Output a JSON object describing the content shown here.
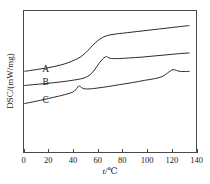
{
  "chart_data": {
    "type": "line",
    "title": "",
    "xlabel": "t/℃",
    "ylabel": "DSC/(mW/mg)",
    "xlim": [
      0,
      140
    ],
    "xticks": [
      0,
      20,
      40,
      60,
      80,
      100,
      120,
      140
    ],
    "xtick_labels": [
      "0",
      "20",
      "40",
      "60",
      "80",
      "100",
      "120",
      "140"
    ],
    "yticks": [],
    "ytick_labels": [],
    "grid": false,
    "legend": "inline-curve-labels",
    "series": [
      {
        "name": "A",
        "label": "A",
        "label_x": 18,
        "label_y": 0.565,
        "color": "#2b2b2b",
        "x": [
          1,
          6,
          12,
          18,
          24,
          30,
          36,
          42,
          46,
          50,
          54,
          58,
          62,
          66,
          70,
          74,
          78,
          84,
          92,
          100,
          110,
          120,
          130,
          134
        ],
        "y": [
          0.572,
          0.578,
          0.586,
          0.594,
          0.604,
          0.616,
          0.632,
          0.654,
          0.672,
          0.7,
          0.736,
          0.772,
          0.8,
          0.818,
          0.828,
          0.834,
          0.838,
          0.844,
          0.852,
          0.86,
          0.87,
          0.88,
          0.89,
          0.894
        ]
      },
      {
        "name": "B",
        "label": "B",
        "label_x": 18,
        "label_y": 0.472,
        "color": "#2b2b2b",
        "x": [
          1,
          8,
          16,
          24,
          32,
          40,
          46,
          50,
          54,
          58,
          61,
          64,
          66,
          67,
          68,
          70,
          73,
          78,
          86,
          96,
          106,
          116,
          126,
          134
        ],
        "y": [
          0.472,
          0.478,
          0.484,
          0.491,
          0.499,
          0.509,
          0.518,
          0.528,
          0.548,
          0.588,
          0.626,
          0.658,
          0.672,
          0.676,
          0.672,
          0.664,
          0.661,
          0.662,
          0.666,
          0.672,
          0.68,
          0.688,
          0.696,
          0.701
        ]
      },
      {
        "name": "C",
        "label": "C",
        "label_x": 18,
        "label_y": 0.348,
        "color": "#2b2b2b",
        "x": [
          1,
          8,
          16,
          24,
          30,
          36,
          40,
          42,
          44,
          45,
          46,
          48,
          50,
          54,
          60,
          68,
          78,
          88,
          98,
          106,
          112,
          116,
          119,
          121,
          123,
          125,
          128,
          131,
          134
        ],
        "y": [
          0.345,
          0.357,
          0.372,
          0.388,
          0.4,
          0.414,
          0.426,
          0.44,
          0.462,
          0.47,
          0.464,
          0.452,
          0.448,
          0.448,
          0.454,
          0.464,
          0.478,
          0.492,
          0.508,
          0.52,
          0.534,
          0.556,
          0.575,
          0.583,
          0.581,
          0.574,
          0.57,
          0.57,
          0.571
        ]
      }
    ]
  },
  "axes": {
    "x_axis_name": "temperature-axis",
    "y_axis_name": "heat-flow-axis"
  }
}
